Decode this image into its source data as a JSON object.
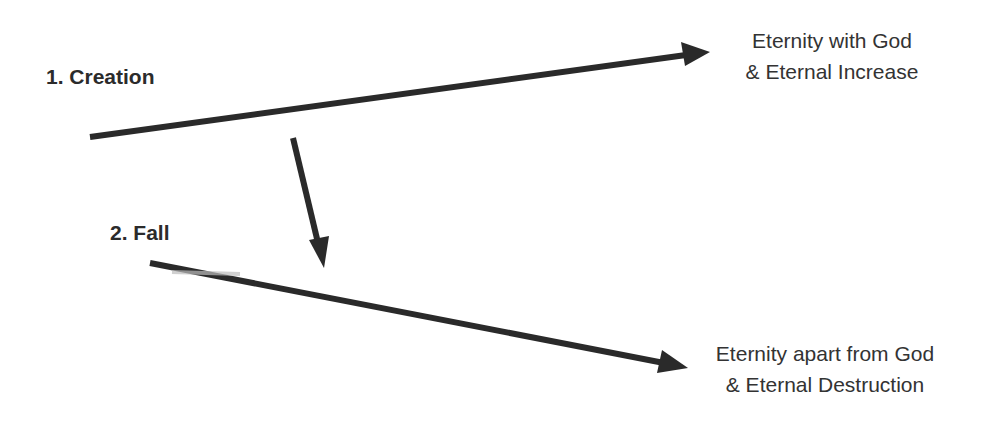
{
  "diagram": {
    "stages": [
      {
        "id": "creation",
        "label": "1. Creation"
      },
      {
        "id": "fall",
        "label": "2. Fall"
      }
    ],
    "outcomes": {
      "upper": {
        "line1": "Eternity with God",
        "line2": "& Eternal Increase"
      },
      "lower": {
        "line1": "Eternity apart from God",
        "line2": "& Eternal Destruction"
      }
    },
    "arrows": [
      {
        "id": "creation-path",
        "from": "1. Creation",
        "to": "Eternity with God & Eternal Increase",
        "x1": 90,
        "y1": 137,
        "x2": 710,
        "y2": 52
      },
      {
        "id": "fall-transition",
        "from": "1. Creation",
        "to": "2. Fall",
        "x1": 293,
        "y1": 138,
        "x2": 324,
        "y2": 268
      },
      {
        "id": "fall-path",
        "from": "2. Fall",
        "to": "Eternity apart from God & Eternal Destruction",
        "x1": 150,
        "y1": 263,
        "x2": 688,
        "y2": 368
      }
    ],
    "colors": {
      "line": "#2a2a2a",
      "text": "#333333",
      "background": "#ffffff"
    }
  }
}
